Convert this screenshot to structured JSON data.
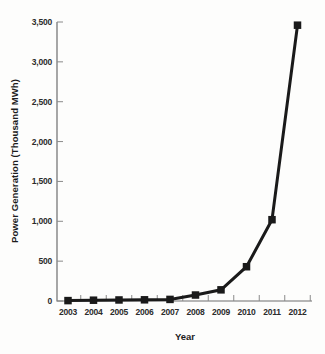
{
  "figure": {
    "ylabel": "Power Generation (Thousand MWh)",
    "xlabel": "Year"
  },
  "chart_data": {
    "type": "line",
    "title": "",
    "xlabel": "Year",
    "ylabel": "Power Generation (Thousand MWh)",
    "categories": [
      "2003",
      "2004",
      "2005",
      "2006",
      "2007",
      "2008",
      "2009",
      "2010",
      "2011",
      "2012"
    ],
    "series": [
      {
        "name": "Power Generation",
        "values": [
          5,
          10,
          13,
          15,
          20,
          75,
          140,
          430,
          1020,
          3460
        ]
      }
    ],
    "ylim": [
      0,
      3500
    ],
    "y_tick_values": [
      0,
      500,
      1000,
      1500,
      2000,
      2500,
      3000,
      3500
    ],
    "y_tick_labels": [
      "0",
      "500",
      "1,000",
      "1,500",
      "2,000",
      "2,500",
      "3,000",
      "3,500"
    ],
    "marker": "square",
    "grid": false,
    "legend_position": "none",
    "line_color": "#1a1a1a",
    "marker_color": "#1a1a1a",
    "axis_color": "#6e6e6e",
    "tick_color": "#8a8a8a",
    "tick_label_color": "#2b2b2b"
  }
}
